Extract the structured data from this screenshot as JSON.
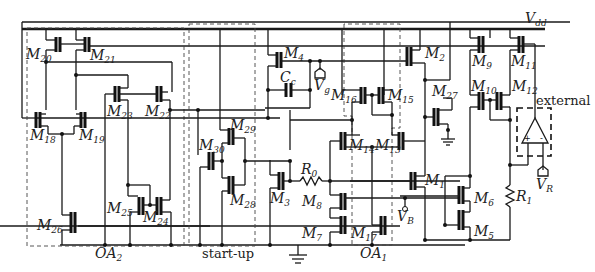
{
  "diagram": {
    "supply": {
      "name": "V",
      "sub": "dd"
    },
    "transistors": [
      {
        "id": "M20",
        "name": "M",
        "sub": "20"
      },
      {
        "id": "M21",
        "name": "M",
        "sub": "21"
      },
      {
        "id": "M23",
        "name": "M",
        "sub": "23"
      },
      {
        "id": "M22",
        "name": "M",
        "sub": "22"
      },
      {
        "id": "M18",
        "name": "M",
        "sub": "18"
      },
      {
        "id": "M19",
        "name": "M",
        "sub": "19"
      },
      {
        "id": "M25",
        "name": "M",
        "sub": "25"
      },
      {
        "id": "M24",
        "name": "M",
        "sub": "24"
      },
      {
        "id": "M26",
        "name": "M",
        "sub": "26"
      },
      {
        "id": "M29",
        "name": "M",
        "sub": "29"
      },
      {
        "id": "M30",
        "name": "M",
        "sub": "30"
      },
      {
        "id": "M28",
        "name": "M",
        "sub": "28"
      },
      {
        "id": "M4",
        "name": "M",
        "sub": "4"
      },
      {
        "id": "M3",
        "name": "M",
        "sub": "3"
      },
      {
        "id": "M8",
        "name": "M",
        "sub": "8"
      },
      {
        "id": "M7",
        "name": "M",
        "sub": "7"
      },
      {
        "id": "M16",
        "name": "M",
        "sub": "16"
      },
      {
        "id": "M15",
        "name": "M",
        "sub": "15"
      },
      {
        "id": "M14",
        "name": "M",
        "sub": "14"
      },
      {
        "id": "M13",
        "name": "M",
        "sub": "13"
      },
      {
        "id": "M17",
        "name": "M",
        "sub": "17"
      },
      {
        "id": "M2",
        "name": "M",
        "sub": "2"
      },
      {
        "id": "M27",
        "name": "M",
        "sub": "27"
      },
      {
        "id": "M1",
        "name": "M",
        "sub": "1"
      },
      {
        "id": "M9",
        "name": "M",
        "sub": "9"
      },
      {
        "id": "M11",
        "name": "M",
        "sub": "11"
      },
      {
        "id": "M10",
        "name": "M",
        "sub": "10"
      },
      {
        "id": "M12",
        "name": "M",
        "sub": "12"
      },
      {
        "id": "M6",
        "name": "M",
        "sub": "6"
      },
      {
        "id": "M5",
        "name": "M",
        "sub": "5"
      }
    ],
    "passives": {
      "cc": {
        "name": "C",
        "sub": "c"
      },
      "r0": {
        "name": "R",
        "sub": "0"
      },
      "r1": {
        "name": "R",
        "sub": "1"
      }
    },
    "nodes": {
      "vg": {
        "name": "V",
        "sub": "g"
      },
      "vb": {
        "name": "V",
        "sub": "B"
      },
      "vr": {
        "name": "V",
        "sub": "R"
      }
    },
    "blocks": {
      "oa2": {
        "name": "OA",
        "sub": "2"
      },
      "startup": {
        "label": "start-up"
      },
      "oa1": {
        "name": "OA",
        "sub": "1"
      },
      "external": {
        "label": "external"
      }
    }
  }
}
